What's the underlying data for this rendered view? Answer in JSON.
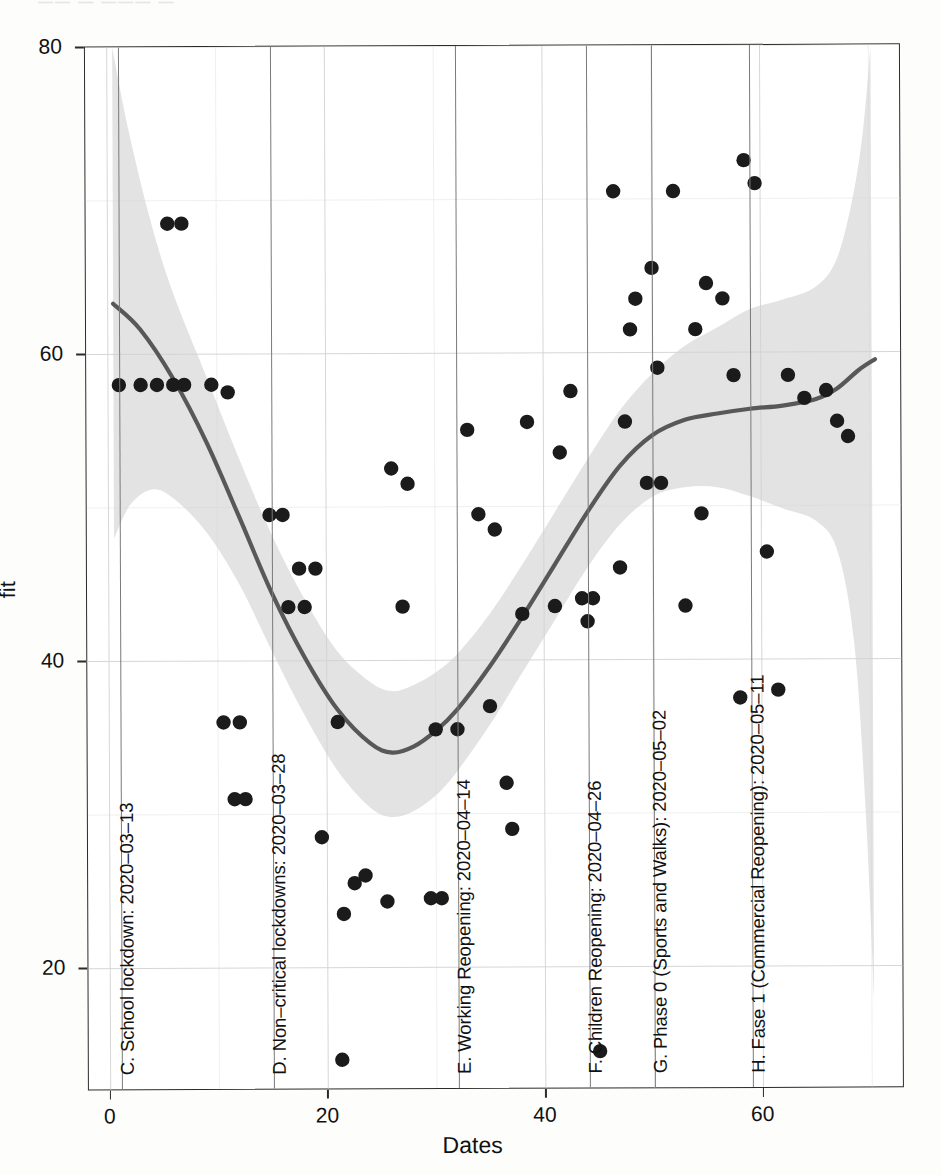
{
  "figure": {
    "top_edge_artifact": "——        — ——— —"
  },
  "axes": {
    "y_title": "fit",
    "x_title": "Dates",
    "y_ticks": [
      "20",
      "40",
      "60",
      "80"
    ],
    "x_ticks": [
      "0",
      "20",
      "40",
      "60"
    ]
  },
  "annotations": [
    {
      "id": "c",
      "label": "C. School lockdown: 2020–03–13",
      "x": 1
    },
    {
      "id": "d",
      "label": "D. Non–critical lockdowns: 2020–03–28",
      "x": 15
    },
    {
      "id": "e",
      "label": "E. Working Reopening: 2020–04–14",
      "x": 32
    },
    {
      "id": "f",
      "label": "F. Children Reopening: 2020–04–26",
      "x": 44
    },
    {
      "id": "g",
      "label": "G. Phase 0 (Sports and Walks): 2020–05–02",
      "x": 50
    },
    {
      "id": "h",
      "label": "H. Fase 1 (Commercial Reopening): 2020–05–11",
      "x": 59
    }
  ],
  "colors": {
    "point": "#1b1b1b",
    "fit_line": "#585858",
    "confidence_band": "#d2d2d2",
    "grid_major": "#d6d6d6",
    "grid_minor": "#ededed",
    "annotation_line": "#7a7a7a",
    "panel_border": "#2b2b2b",
    "background": "#ffffff"
  },
  "chart_data": {
    "type": "scatter",
    "title": "",
    "xlabel": "Dates",
    "ylabel": "fit",
    "xlim": [
      -2,
      73
    ],
    "ylim": [
      12,
      80
    ],
    "grid": true,
    "legend": "none",
    "x_ticks": [
      0,
      20,
      40,
      60
    ],
    "y_ticks": [
      20,
      40,
      60,
      80
    ],
    "x_minor_ticks": [
      10,
      30,
      50,
      70
    ],
    "y_minor_ticks": [
      30,
      50,
      70
    ],
    "points": [
      [
        1,
        58
      ],
      [
        3,
        58
      ],
      [
        4.5,
        58
      ],
      [
        6,
        58
      ],
      [
        7,
        58
      ],
      [
        5.5,
        68.5
      ],
      [
        6.8,
        68.5
      ],
      [
        9.5,
        58
      ],
      [
        11,
        57.5
      ],
      [
        10.5,
        36
      ],
      [
        12,
        36
      ],
      [
        11.5,
        31
      ],
      [
        12.5,
        31
      ],
      [
        14.8,
        49.5
      ],
      [
        16,
        49.5
      ],
      [
        17.5,
        46
      ],
      [
        19,
        46
      ],
      [
        16.5,
        43.5
      ],
      [
        18,
        43.5
      ],
      [
        19.5,
        28.5
      ],
      [
        21,
        36
      ],
      [
        21.5,
        23.5
      ],
      [
        22.5,
        25.5
      ],
      [
        21.3,
        14
      ],
      [
        23.5,
        26
      ],
      [
        25.5,
        24.3
      ],
      [
        27,
        43.5
      ],
      [
        26,
        52.5
      ],
      [
        27.5,
        51.5
      ],
      [
        30,
        35.5
      ],
      [
        29.5,
        24.5
      ],
      [
        30.5,
        24.5
      ],
      [
        32,
        35.5
      ],
      [
        34,
        49.5
      ],
      [
        33,
        55
      ],
      [
        35,
        37
      ],
      [
        35.5,
        48.5
      ],
      [
        36.5,
        32
      ],
      [
        37,
        29
      ],
      [
        38,
        43
      ],
      [
        38.5,
        55.5
      ],
      [
        41,
        43.5
      ],
      [
        41.5,
        53.5
      ],
      [
        42.5,
        57.5
      ],
      [
        43.5,
        44
      ],
      [
        44.5,
        44
      ],
      [
        44,
        42.5
      ],
      [
        45,
        14.5
      ],
      [
        46.5,
        70.5
      ],
      [
        47.5,
        55.5
      ],
      [
        48,
        61.5
      ],
      [
        48.5,
        63.5
      ],
      [
        47,
        46
      ],
      [
        49.5,
        51.5
      ],
      [
        50.8,
        51.5
      ],
      [
        50,
        65.5
      ],
      [
        50.5,
        59
      ],
      [
        52,
        70.5
      ],
      [
        53,
        43.5
      ],
      [
        54,
        61.5
      ],
      [
        55,
        64.5
      ],
      [
        54.5,
        49.5
      ],
      [
        56.5,
        63.5
      ],
      [
        57.5,
        58.5
      ],
      [
        58,
        37.5
      ],
      [
        58.5,
        72.5
      ],
      [
        59.5,
        71
      ],
      [
        60.5,
        47
      ],
      [
        61.5,
        38
      ],
      [
        62.5,
        58.5
      ],
      [
        64,
        57
      ],
      [
        66,
        57.5
      ],
      [
        67,
        55.5
      ],
      [
        68,
        54.5
      ]
    ],
    "fit_curve": [
      [
        0.5,
        63.3
      ],
      [
        3,
        61.6
      ],
      [
        6,
        58.4
      ],
      [
        9,
        54.3
      ],
      [
        12,
        49.4
      ],
      [
        15,
        44.4
      ],
      [
        18,
        40.2
      ],
      [
        21,
        36.8
      ],
      [
        24,
        34.6
      ],
      [
        26,
        34.0
      ],
      [
        28,
        34.4
      ],
      [
        30,
        35.4
      ],
      [
        32,
        36.8
      ],
      [
        35,
        39.6
      ],
      [
        38,
        42.8
      ],
      [
        41,
        46.2
      ],
      [
        44,
        49.6
      ],
      [
        47,
        52.6
      ],
      [
        50,
        54.6
      ],
      [
        53,
        55.6
      ],
      [
        56,
        56.0
      ],
      [
        59,
        56.3
      ],
      [
        62,
        56.5
      ],
      [
        65,
        56.9
      ],
      [
        67,
        57.6
      ],
      [
        69,
        58.8
      ],
      [
        70.5,
        59.5
      ]
    ],
    "confidence_band_upper": [
      [
        0.5,
        80
      ],
      [
        2,
        74.5
      ],
      [
        4,
        68.6
      ],
      [
        6,
        64.0
      ],
      [
        9,
        58.6
      ],
      [
        12,
        53.2
      ],
      [
        15,
        48.2
      ],
      [
        18,
        44.0
      ],
      [
        21,
        40.6
      ],
      [
        24,
        38.6
      ],
      [
        26,
        38.0
      ],
      [
        28,
        38.4
      ],
      [
        30,
        39.2
      ],
      [
        32,
        40.4
      ],
      [
        35,
        43.0
      ],
      [
        38,
        46.2
      ],
      [
        41,
        49.6
      ],
      [
        44,
        53.0
      ],
      [
        47,
        56.2
      ],
      [
        50,
        58.6
      ],
      [
        53,
        60.4
      ],
      [
        56,
        61.6
      ],
      [
        59,
        62.8
      ],
      [
        62,
        63.4
      ],
      [
        65,
        64.2
      ],
      [
        67,
        66.0
      ],
      [
        68.5,
        70.0
      ],
      [
        69.5,
        74.5
      ],
      [
        70.2,
        79.8
      ]
    ],
    "confidence_band_lower": [
      [
        0.5,
        48.0
      ],
      [
        2,
        50.2
      ],
      [
        4,
        51.2
      ],
      [
        6,
        50.6
      ],
      [
        9,
        48.4
      ],
      [
        12,
        45.0
      ],
      [
        15,
        40.6
      ],
      [
        18,
        36.4
      ],
      [
        21,
        32.8
      ],
      [
        24,
        30.4
      ],
      [
        26,
        29.8
      ],
      [
        28,
        30.2
      ],
      [
        30,
        31.2
      ],
      [
        32,
        32.8
      ],
      [
        35,
        35.8
      ],
      [
        38,
        39.2
      ],
      [
        41,
        42.6
      ],
      [
        44,
        46.0
      ],
      [
        47,
        48.8
      ],
      [
        50,
        50.6
      ],
      [
        53,
        51.2
      ],
      [
        56,
        51.2
      ],
      [
        59,
        50.6
      ],
      [
        62,
        49.8
      ],
      [
        65,
        49.0
      ],
      [
        67,
        47.0
      ],
      [
        68.5,
        41.0
      ],
      [
        69.5,
        30.0
      ],
      [
        70.2,
        18.0
      ]
    ]
  }
}
